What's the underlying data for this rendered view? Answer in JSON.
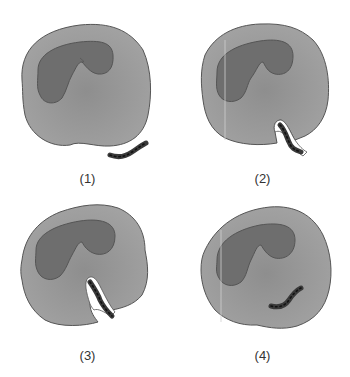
{
  "figure": {
    "colors": {
      "cytoplasm": "#9a9a9a",
      "nucleus": "#6f6f6f",
      "outline": "#555555",
      "bacterium": "#3a3a3a",
      "vacuole": "#ffffff"
    },
    "panels": [
      {
        "label": "(1)"
      },
      {
        "label": "(2)"
      },
      {
        "label": "(3)"
      },
      {
        "label": "(4)"
      }
    ]
  }
}
